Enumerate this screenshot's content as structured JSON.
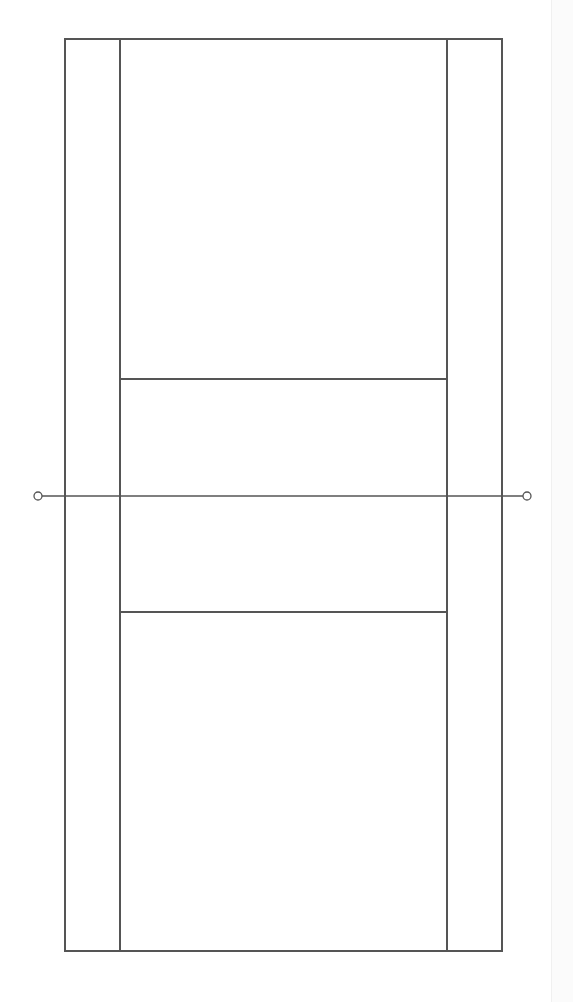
{
  "diagram": {
    "type": "badminton-court",
    "colors": {
      "background": "#ffffff",
      "line": "#555555",
      "strip": "#fbfbfb"
    },
    "line_width": 1.3,
    "court": {
      "outer": {
        "x": 65,
        "y": 39,
        "width": 437,
        "height": 912
      },
      "sideline_left_x": 120,
      "sideline_right_x": 447,
      "service_line_top_y": 379,
      "service_line_bottom_y": 612
    },
    "net": {
      "y": 496,
      "x1": 42,
      "x2": 523,
      "post_left": {
        "cx": 38,
        "cy": 496,
        "r": 4
      },
      "post_right": {
        "cx": 527,
        "cy": 496,
        "r": 4
      }
    }
  }
}
